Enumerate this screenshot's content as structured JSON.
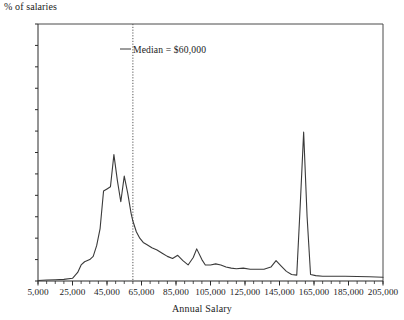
{
  "chart_data": {
    "type": "line",
    "title": "",
    "xlabel": "Annual Salary",
    "ylabel": "% of salaries",
    "xlim": [
      5000,
      205000
    ],
    "ylim": [
      0,
      24
    ],
    "grid": false,
    "legend_position": "none",
    "y_ticks": [
      0,
      2,
      4,
      6,
      8,
      10,
      12,
      14,
      16,
      18,
      20,
      22,
      24
    ],
    "y_tick_labels": [
      "0",
      "2",
      "4",
      "6",
      "8",
      "10",
      "12",
      "14",
      "16",
      "18",
      "20",
      "22",
      "24"
    ],
    "x_ticks": [
      5000,
      25000,
      45000,
      65000,
      85000,
      105000,
      125000,
      145000,
      165000,
      185000,
      205000
    ],
    "x_tick_labels": [
      "5,000",
      "25,000",
      "45,000",
      "65,000",
      "85,000",
      "105,000",
      "125,000",
      "145,000",
      "165,000",
      "185,000",
      "205,000"
    ],
    "x_minor_tick_step": 5000,
    "annotations": [
      {
        "name": "median-line",
        "label": "Median = $60,000",
        "x": 60000,
        "style": "dotted-vertical"
      }
    ],
    "series": [
      {
        "name": "% of salaries",
        "color": "#3a3a3a",
        "x": [
          5000,
          10000,
          15000,
          20000,
          25000,
          28000,
          30000,
          32000,
          35000,
          37000,
          39000,
          41000,
          43000,
          45000,
          47000,
          49000,
          51000,
          53000,
          55000,
          57000,
          59000,
          60000,
          62000,
          64000,
          66000,
          68000,
          71000,
          74000,
          77000,
          80000,
          83000,
          86000,
          89000,
          92000,
          95000,
          97000,
          100000,
          102000,
          105000,
          108000,
          111000,
          114000,
          117000,
          120000,
          124000,
          128000,
          132000,
          136000,
          140000,
          143000,
          146000,
          149000,
          152000,
          155000,
          157000,
          159000,
          161000,
          163000,
          166000,
          170000,
          176000,
          183000,
          190000,
          197000,
          205000
        ],
        "y": [
          0.05,
          0.1,
          0.12,
          0.15,
          0.25,
          0.8,
          1.5,
          1.8,
          2.0,
          2.3,
          3.3,
          4.9,
          8.4,
          8.6,
          8.8,
          11.8,
          9.4,
          7.4,
          9.8,
          8.2,
          6.3,
          5.6,
          4.6,
          4.0,
          3.6,
          3.4,
          3.1,
          2.9,
          2.6,
          2.3,
          2.1,
          2.4,
          1.9,
          1.5,
          2.2,
          3.0,
          2.0,
          1.5,
          1.5,
          1.6,
          1.5,
          1.3,
          1.2,
          1.15,
          1.2,
          1.1,
          1.1,
          1.1,
          1.3,
          1.9,
          1.4,
          0.9,
          0.6,
          0.55,
          7.0,
          13.9,
          6.0,
          0.6,
          0.5,
          0.45,
          0.45,
          0.45,
          0.42,
          0.4,
          0.35
        ]
      }
    ]
  }
}
